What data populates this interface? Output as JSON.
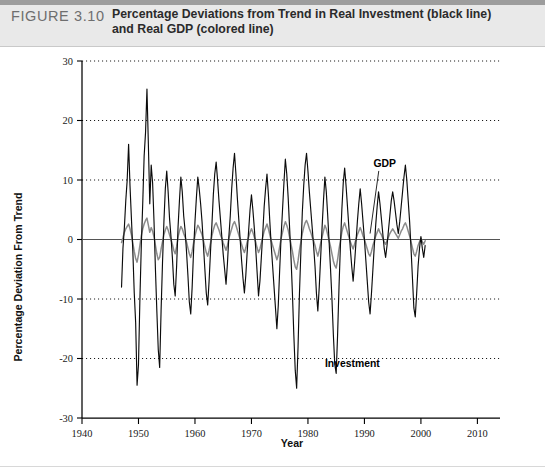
{
  "figure": {
    "number_label": "FIGURE 3.10",
    "title_line1": "Percentage Deviations from Trend in Real Investment (black line)",
    "title_line2": "and Real GDP (colored line)",
    "header_bg": "#e9e9e9",
    "rule_color": "#9d9d9d"
  },
  "chart_data": {
    "type": "line",
    "title": "Percentage Deviations from Trend in Real Investment (black line) and Real GDP (colored line)",
    "xlabel": "Year",
    "ylabel": "Percentage Deviation From Trend",
    "xlim": [
      1940,
      2014
    ],
    "ylim": [
      -30,
      30
    ],
    "xticks": [
      1940,
      1950,
      1960,
      1970,
      1980,
      1990,
      2000,
      2010
    ],
    "yticks": [
      30,
      20,
      10,
      0,
      -10,
      -20,
      -30
    ],
    "xtick_labels": [
      "1940",
      "1950",
      "1960",
      "1970",
      "1980",
      "1990",
      "2000",
      "2010"
    ],
    "ytick_labels": [
      "30",
      "20",
      "10",
      "0",
      "-10",
      "-20",
      "-30"
    ],
    "grid": "horizontal-dotted",
    "legend": "inline-annotations",
    "annotations": [
      {
        "text": "GDP",
        "x": 1993.6,
        "y": 12.2
      },
      {
        "text": "Investment",
        "x": 1983.0,
        "y": -21.5
      }
    ],
    "series": [
      {
        "name": "Investment",
        "color": "#0b0b0b",
        "x_start": 1947.0,
        "x_step": 0.25,
        "values": [
          -8.0,
          -1.5,
          2.0,
          6.5,
          10.0,
          16.0,
          9.0,
          3.5,
          -2.0,
          -9.0,
          -14.0,
          -24.5,
          -21.0,
          -10.0,
          -1.0,
          6.0,
          14.0,
          18.0,
          25.3,
          16.0,
          6.0,
          12.5,
          9.5,
          3.0,
          -5.0,
          -12.0,
          -18.5,
          -21.5,
          -12.0,
          -4.0,
          3.0,
          8.5,
          11.5,
          8.0,
          3.5,
          0.5,
          -3.0,
          -7.5,
          -9.5,
          -4.5,
          2.0,
          6.5,
          10.5,
          8.0,
          4.0,
          1.5,
          -2.0,
          -6.0,
          -10.5,
          -12.5,
          -8.0,
          -2.0,
          3.0,
          7.0,
          10.5,
          8.5,
          6.0,
          3.0,
          -1.0,
          -5.0,
          -9.0,
          -11.0,
          -7.0,
          -2.0,
          2.5,
          7.5,
          11.0,
          13.0,
          10.0,
          6.5,
          3.5,
          0.5,
          -2.5,
          -5.0,
          -7.5,
          -4.0,
          0.5,
          4.0,
          8.5,
          12.0,
          14.5,
          11.0,
          7.0,
          3.5,
          0.0,
          -3.5,
          -6.5,
          -9.0,
          -6.0,
          -2.0,
          1.5,
          5.0,
          7.5,
          5.0,
          2.0,
          -1.5,
          -5.5,
          -9.5,
          -7.0,
          -3.0,
          1.0,
          5.5,
          8.5,
          11.0,
          7.5,
          3.0,
          -1.0,
          -4.5,
          -8.0,
          -11.5,
          -15.0,
          -11.0,
          -5.0,
          0.5,
          5.0,
          9.5,
          13.5,
          11.0,
          7.0,
          2.0,
          -3.0,
          -9.0,
          -16.0,
          -22.0,
          -25.0,
          -18.0,
          -9.0,
          -2.0,
          4.5,
          9.0,
          12.5,
          14.5,
          11.5,
          8.0,
          5.0,
          2.0,
          -1.0,
          -4.5,
          -9.0,
          -12.0,
          -8.0,
          -3.0,
          2.0,
          6.5,
          10.5,
          8.0,
          4.0,
          -0.5,
          -5.0,
          -10.0,
          -16.0,
          -21.0,
          -22.5,
          -16.0,
          -8.0,
          -1.0,
          5.0,
          9.5,
          12.0,
          9.0,
          5.5,
          2.0,
          -1.5,
          -4.5,
          -7.0,
          -4.0,
          -0.5,
          3.0,
          6.0,
          8.5,
          6.0,
          3.0,
          0.0,
          -3.5,
          -7.0,
          -10.5,
          -12.5,
          -9.0,
          -5.0,
          -1.0,
          2.5,
          5.5,
          8.0,
          6.0,
          3.5,
          1.0,
          -1.5,
          -3.0,
          -1.0,
          1.5,
          4.0,
          6.5,
          8.0,
          6.5,
          4.5,
          2.5,
          1.0,
          3.0,
          5.5,
          8.0,
          10.5,
          12.5,
          10.0,
          6.5,
          3.0,
          -1.5,
          -6.5,
          -11.5,
          -13.0,
          -9.0,
          -4.5,
          -1.5,
          0.5,
          -1.5,
          -3.0,
          -1.0
        ]
      },
      {
        "name": "GDP",
        "color": "#8b8b8b",
        "x_start": 1947.0,
        "x_step": 0.25,
        "values": [
          -0.5,
          0.3,
          1.2,
          1.8,
          2.2,
          2.6,
          1.8,
          0.8,
          -0.6,
          -2.0,
          -3.2,
          -3.8,
          -2.6,
          -1.0,
          0.6,
          1.8,
          2.6,
          3.2,
          3.6,
          2.4,
          1.2,
          2.0,
          1.4,
          0.4,
          -1.0,
          -2.4,
          -3.4,
          -3.0,
          -1.6,
          -0.4,
          0.8,
          1.6,
          2.2,
          1.6,
          0.8,
          0.0,
          -0.8,
          -1.8,
          -2.4,
          -1.2,
          0.4,
          1.4,
          2.2,
          1.8,
          1.0,
          0.4,
          -0.4,
          -1.4,
          -2.4,
          -3.0,
          -2.0,
          -0.6,
          0.6,
          1.6,
          2.4,
          2.0,
          1.4,
          0.8,
          -0.2,
          -1.2,
          -2.2,
          -2.8,
          -1.8,
          -0.6,
          0.6,
          1.6,
          2.4,
          2.8,
          2.2,
          1.6,
          0.8,
          0.2,
          -0.6,
          -1.2,
          -1.8,
          -1.0,
          0.2,
          1.0,
          1.8,
          2.6,
          3.0,
          2.4,
          1.6,
          0.8,
          0.0,
          -0.8,
          -1.6,
          -2.2,
          -1.4,
          -0.4,
          0.4,
          1.2,
          1.8,
          1.2,
          0.4,
          -0.4,
          -1.4,
          -2.2,
          -1.6,
          -0.6,
          0.4,
          1.4,
          2.0,
          2.6,
          1.8,
          0.8,
          -0.2,
          -1.0,
          -1.8,
          -2.6,
          -3.4,
          -2.6,
          -1.2,
          0.2,
          1.2,
          2.2,
          3.0,
          2.4,
          1.6,
          0.4,
          -0.8,
          -2.0,
          -3.4,
          -4.6,
          -5.0,
          -3.6,
          -1.8,
          -0.4,
          1.0,
          2.0,
          2.8,
          3.2,
          2.6,
          1.8,
          1.2,
          0.4,
          -0.2,
          -1.0,
          -2.0,
          -2.8,
          -1.8,
          -0.6,
          0.4,
          1.4,
          2.4,
          1.8,
          0.8,
          -0.2,
          -1.2,
          -2.4,
          -3.6,
          -4.4,
          -4.8,
          -3.4,
          -1.6,
          -0.2,
          1.2,
          2.2,
          2.8,
          2.0,
          1.2,
          0.4,
          -0.4,
          -1.0,
          -1.6,
          -0.8,
          0.0,
          0.8,
          1.4,
          2.0,
          1.4,
          0.6,
          0.0,
          -0.8,
          -1.6,
          -2.4,
          -2.8,
          -2.0,
          -1.0,
          -0.2,
          0.6,
          1.2,
          1.8,
          1.2,
          0.8,
          0.2,
          -0.4,
          -0.8,
          -0.2,
          0.4,
          1.0,
          1.4,
          1.8,
          1.4,
          1.0,
          0.6,
          0.2,
          0.8,
          1.4,
          1.8,
          2.4,
          2.8,
          2.2,
          1.4,
          0.6,
          -0.4,
          -1.4,
          -2.4,
          -2.8,
          -2.0,
          -1.0,
          -0.4,
          0.2,
          -0.4,
          -0.8,
          -0.2
        ]
      }
    ]
  }
}
